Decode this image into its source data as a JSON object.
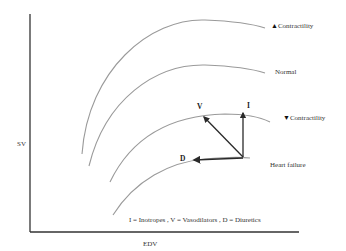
{
  "diagram": {
    "axes": {
      "y_label": "SV",
      "x_label": "EDV"
    },
    "curves": [
      {
        "id": "increased-contractility",
        "label": "Contractility",
        "glyph": "🠩",
        "direction": "up"
      },
      {
        "id": "normal",
        "label": "Normal"
      },
      {
        "id": "decreased-contractility",
        "label": "Contractility",
        "glyph": "🠫",
        "direction": "down"
      },
      {
        "id": "heart-failure",
        "label": "Heart failure"
      }
    ],
    "arrows": [
      {
        "id": "inotropes",
        "label": "I"
      },
      {
        "id": "vasodilators",
        "label": "V"
      },
      {
        "id": "diuretics",
        "label": "D"
      }
    ],
    "legend": "I = Inotropes , V = Vasodilators , D = Diuretics",
    "colors": {
      "curve": "#9a9a9a",
      "axis": "#333333",
      "arrow": "#2a2a2a"
    }
  }
}
